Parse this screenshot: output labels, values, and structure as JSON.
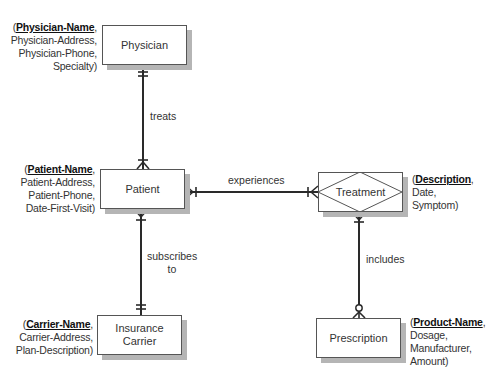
{
  "entities": {
    "physician": {
      "name": "Physician",
      "attr_open": "(",
      "key": "Physician-Name",
      "key_suffix": ",",
      "attrs": [
        "Physician-Address,",
        "Physician-Phone,",
        "Specialty)"
      ]
    },
    "patient": {
      "name": "Patient",
      "attr_open": "(",
      "key": "Patient-Name",
      "key_suffix": ",",
      "attrs": [
        "Patient-Address,",
        "Patient-Phone,",
        "Date-First-Visit)"
      ]
    },
    "insurance_carrier": {
      "name_line1": "Insurance",
      "name_line2": "Carrier",
      "attr_open": "(",
      "key": "Carrier-Name",
      "key_suffix": ",",
      "attrs": [
        "Carrier-Address,",
        "Plan-Description)"
      ]
    },
    "treatment": {
      "name": "Treatment",
      "type": "associative entity",
      "attr_open": "(",
      "key": "Description",
      "key_suffix": ",",
      "attrs": [
        "Date,",
        "Symptom)"
      ]
    },
    "prescription": {
      "name": "Prescription",
      "attr_open": "(",
      "key": "Product-Name",
      "key_suffix": ",",
      "attrs": [
        "Dosage,",
        "Manufacturer,",
        "Amount)"
      ]
    }
  },
  "relationships": {
    "treats": {
      "label": "treats",
      "from": "Physician",
      "from_cardinality": "one and only one",
      "to": "Patient",
      "to_cardinality": "one or many"
    },
    "experiences": {
      "label": "experiences",
      "from": "Patient",
      "from_cardinality": "one or many",
      "to": "Treatment",
      "to_cardinality": "one or many"
    },
    "subscribes_to": {
      "label_line1": "subscribes",
      "label_line2": "to",
      "from": "Patient",
      "from_cardinality": "one or many",
      "to": "Insurance Carrier",
      "to_cardinality": "one and only one"
    },
    "includes": {
      "label": "includes",
      "from": "Treatment",
      "from_cardinality": "one or many",
      "to": "Prescription",
      "to_cardinality": "zero or many"
    }
  },
  "colors": {
    "line": "#2a2a2a",
    "box_border": "#555555",
    "shadow": "#b5b5b5"
  }
}
